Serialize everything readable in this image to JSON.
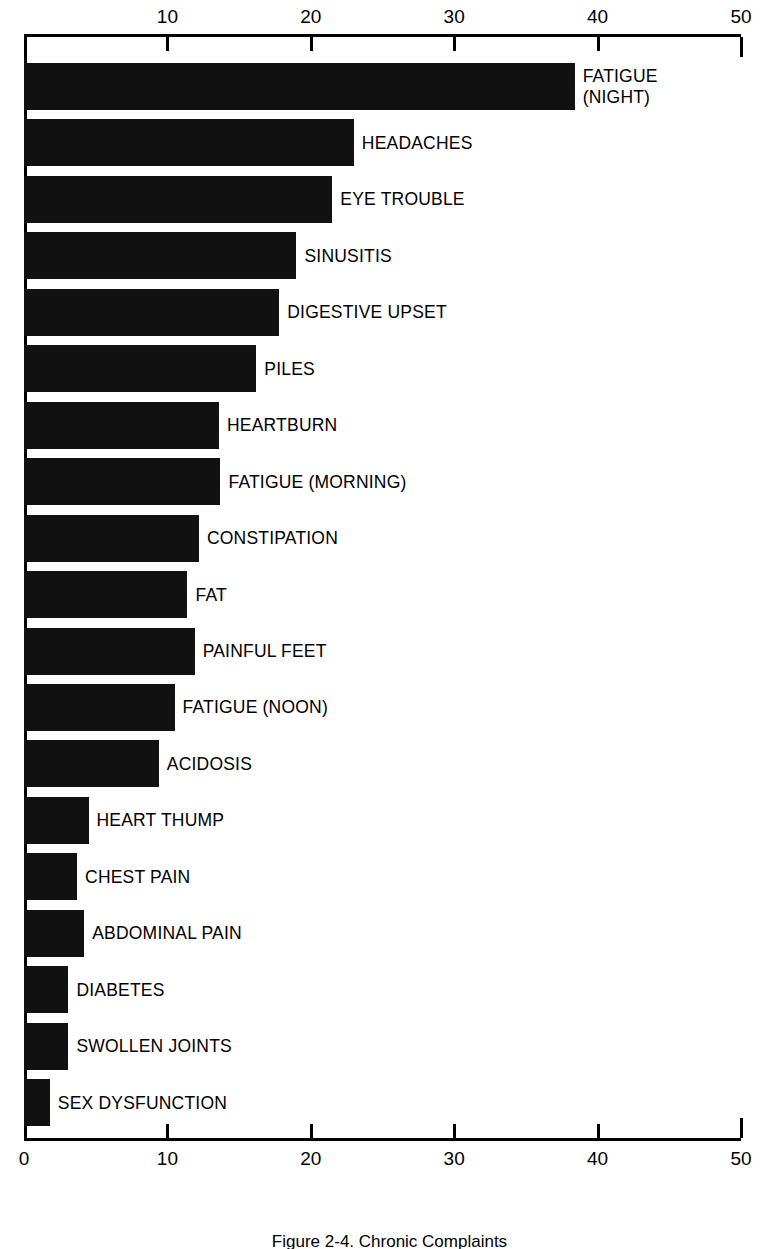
{
  "chart_data": {
    "type": "bar",
    "orientation": "horizontal",
    "title": "Figure 2-4. Chronic Complaints",
    "xlabel": "",
    "ylabel": "",
    "xlim": [
      0,
      50
    ],
    "grid": false,
    "legend": null,
    "axis_color": "#000000",
    "bar_color": "#111111",
    "background_color": "#ffffff",
    "top_axis_ticks": [
      "10",
      "20",
      "30",
      "40",
      "50"
    ],
    "top_axis_tick_values": [
      10,
      20,
      30,
      40,
      50
    ],
    "bottom_axis_ticks": [
      "0",
      "10",
      "20",
      "30",
      "40",
      "50"
    ],
    "bottom_axis_tick_values": [
      0,
      10,
      20,
      30,
      40,
      50
    ],
    "categories": [
      "FATIGUE\n(NIGHT)",
      "HEADACHES",
      "EYE TROUBLE",
      "SINUSITIS",
      "DIGESTIVE UPSET",
      "PILES",
      "HEARTBURN",
      "FATIGUE (MORNING)",
      "CONSTIPATION",
      "FAT",
      "PAINFUL FEET",
      "FATIGUE (NOON)",
      "ACIDOSIS",
      "HEART THUMP",
      "CHEST PAIN",
      "ABDOMINAL PAIN",
      "DIABETES",
      "SWOLLEN JOINTS",
      "SEX DYSFUNCTION"
    ],
    "values": [
      38.4,
      23.0,
      21.5,
      19.0,
      17.8,
      16.2,
      13.6,
      13.7,
      12.2,
      11.4,
      11.9,
      10.5,
      9.4,
      4.5,
      3.7,
      4.2,
      3.1,
      3.1,
      1.8
    ],
    "bars": [
      {
        "label": "FATIGUE\n(NIGHT)",
        "value": 38.4,
        "two_line": true
      },
      {
        "label": "HEADACHES",
        "value": 23.0,
        "two_line": false
      },
      {
        "label": "EYE TROUBLE",
        "value": 21.5,
        "two_line": false
      },
      {
        "label": "SINUSITIS",
        "value": 19.0,
        "two_line": false
      },
      {
        "label": "DIGESTIVE UPSET",
        "value": 17.8,
        "two_line": false
      },
      {
        "label": "PILES",
        "value": 16.2,
        "two_line": false
      },
      {
        "label": "HEARTBURN",
        "value": 13.6,
        "two_line": false
      },
      {
        "label": "FATIGUE (MORNING)",
        "value": 13.7,
        "two_line": false
      },
      {
        "label": "CONSTIPATION",
        "value": 12.2,
        "two_line": false
      },
      {
        "label": "FAT",
        "value": 11.4,
        "two_line": false
      },
      {
        "label": "PAINFUL FEET",
        "value": 11.9,
        "two_line": false
      },
      {
        "label": "FATIGUE (NOON)",
        "value": 10.5,
        "two_line": false
      },
      {
        "label": "ACIDOSIS",
        "value": 9.4,
        "two_line": false
      },
      {
        "label": "HEART THUMP",
        "value": 4.5,
        "two_line": false
      },
      {
        "label": "CHEST PAIN",
        "value": 3.7,
        "two_line": false
      },
      {
        "label": "ABDOMINAL PAIN",
        "value": 4.2,
        "two_line": false
      },
      {
        "label": "DIABETES",
        "value": 3.1,
        "two_line": false
      },
      {
        "label": "SWOLLEN JOINTS",
        "value": 3.1,
        "two_line": false
      },
      {
        "label": "SEX DYSFUNCTION",
        "value": 1.8,
        "two_line": false
      }
    ]
  },
  "caption": {
    "text": "Figure 2-4.  Chronic Complaints"
  }
}
